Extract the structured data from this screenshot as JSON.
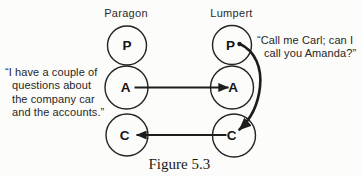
{
  "colors": {
    "ink": "#1d1d1d",
    "paper": "#fcfcfa"
  },
  "figure": {
    "caption": "Figure 5.3"
  },
  "columns": [
    {
      "name": "Paragon",
      "nodes": [
        "P",
        "A",
        "C"
      ]
    },
    {
      "name": "Lumpert",
      "nodes": [
        "P",
        "A",
        "C"
      ]
    }
  ],
  "quotes": {
    "left": {
      "lines": [
        "“I have a couple of",
        "questions about",
        "the company car",
        "and the accounts.”"
      ]
    },
    "right": {
      "lines": [
        "“Call me Carl; can I",
        "call you Amanda?”"
      ]
    }
  },
  "transactions": [
    {
      "from": "Paragon.A",
      "to": "Lumpert.A",
      "style": "straight"
    },
    {
      "from": "Lumpert.C",
      "to": "Paragon.C",
      "style": "straight"
    },
    {
      "from": "Lumpert.P",
      "to": "Lumpert.C",
      "style": "curved"
    }
  ]
}
